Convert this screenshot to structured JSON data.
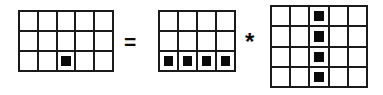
{
  "figure": {
    "background_color": "#ffffff",
    "line_color": "#1a1a1a",
    "fill_color": "#0a0a0a"
  },
  "operators": {
    "equals": {
      "symbol": "=",
      "name": "equals-sign"
    },
    "convolve": {
      "symbol": "*",
      "name": "asterisk-convolution-operator"
    }
  },
  "grids": [
    {
      "id": "grid-result",
      "role": "result",
      "columns": 5,
      "rows": 3,
      "filled_cells": [
        {
          "row": 3,
          "col": 3
        }
      ],
      "cells": [
        [
          0,
          0,
          0,
          0,
          0
        ],
        [
          0,
          0,
          0,
          0,
          0
        ],
        [
          0,
          0,
          1,
          0,
          0
        ]
      ]
    },
    {
      "id": "grid-operand-a",
      "role": "operand-a",
      "columns": 4,
      "rows": 3,
      "filled_cells": [
        {
          "row": 3,
          "col": 1
        },
        {
          "row": 3,
          "col": 2
        },
        {
          "row": 3,
          "col": 3
        },
        {
          "row": 3,
          "col": 4
        }
      ],
      "cells": [
        [
          0,
          0,
          0,
          0
        ],
        [
          0,
          0,
          0,
          0
        ],
        [
          1,
          1,
          1,
          1
        ]
      ]
    },
    {
      "id": "grid-operand-b",
      "role": "operand-b",
      "columns": 5,
      "rows": 4,
      "filled_cells": [
        {
          "row": 1,
          "col": 3
        },
        {
          "row": 2,
          "col": 3
        },
        {
          "row": 3,
          "col": 3
        },
        {
          "row": 4,
          "col": 3
        }
      ],
      "cells": [
        [
          0,
          0,
          1,
          0,
          0
        ],
        [
          0,
          0,
          1,
          0,
          0
        ],
        [
          0,
          0,
          1,
          0,
          0
        ],
        [
          0,
          0,
          1,
          0,
          0
        ]
      ]
    }
  ]
}
